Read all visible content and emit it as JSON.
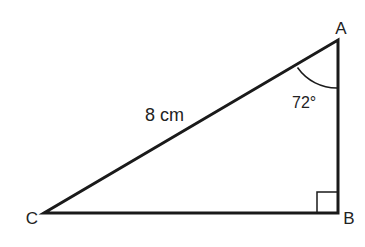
{
  "diagram": {
    "type": "right-triangle",
    "vertices": {
      "A": {
        "label": "A"
      },
      "B": {
        "label": "B"
      },
      "C": {
        "label": "C"
      }
    },
    "hypotenuse_label": "8 cm",
    "angle_A_label": "72°",
    "right_angle_at": "B",
    "colors": {
      "stroke": "#1a1a1a",
      "background": "#ffffff"
    }
  }
}
